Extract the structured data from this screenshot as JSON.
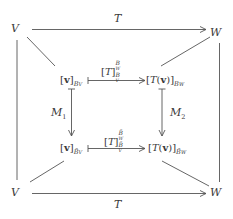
{
  "diagram": {
    "title": "",
    "nodes": {
      "top_left": "V",
      "top_right": "W",
      "bottom_left": "V",
      "bottom_right": "W",
      "inner_top_left": {
        "base": "[v]",
        "sub": "B_V"
      },
      "inner_top_right": {
        "base": "[T(v)]",
        "sub": "B_W"
      },
      "inner_bottom_left": {
        "base": "[v]",
        "sub": "B̃_V"
      },
      "inner_bottom_right": {
        "base": "[T(v)]",
        "sub": "B̃_W"
      }
    },
    "labels": {
      "top_arrow": "T",
      "bottom_arrow": "T",
      "inner_top_arrow": {
        "base": "[T]",
        "sup": "B_W",
        "sub": "B_V"
      },
      "inner_bottom_arrow": {
        "base": "[T]",
        "sup": "B̃_W",
        "sub": "B̃_V"
      },
      "left_vertical": "M",
      "left_vertical_sub": "1",
      "right_vertical": "M",
      "right_vertical_sub": "2"
    },
    "display": {
      "V": "V",
      "W": "W",
      "T": "T",
      "bracket_open": "[",
      "bracket_close": "]",
      "v": "v",
      "T_open": "T(",
      "paren_close": ")",
      "B": "B",
      "B_tilde": "B̃",
      "sub_V": "V",
      "sub_W": "W",
      "M": "M",
      "one": "1",
      "two": "2"
    },
    "colors": {
      "line": "#555555",
      "text": "#3a3a3a",
      "background": "#ffffff"
    }
  }
}
